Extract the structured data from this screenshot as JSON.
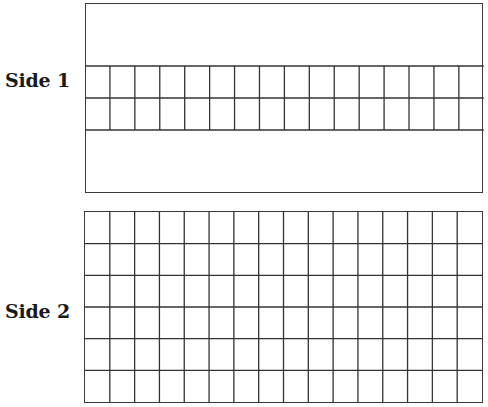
{
  "diagram": {
    "line_color": "#333333",
    "background": "#ffffff",
    "side1": {
      "label": "Side 1",
      "columns": 16,
      "grid_rows": 2,
      "description": "Rectangle with a horizontal band of 2 rows x 16 columns in the middle; blank regions above and below"
    },
    "side2": {
      "label": "Side 2",
      "columns": 16,
      "grid_rows": 6,
      "description": "Full grid of 6 rows x 16 columns"
    }
  }
}
